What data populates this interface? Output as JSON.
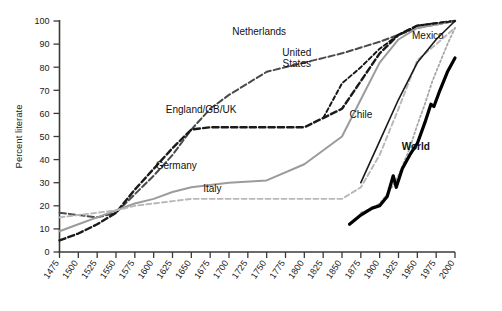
{
  "chart_data": {
    "type": "line",
    "title": "",
    "subtitle": "",
    "xlabel": "",
    "ylabel": "Percent literate",
    "xlim": [
      1475,
      2000
    ],
    "ylim": [
      0,
      100
    ],
    "grid": false,
    "legend_position": "inline-labels",
    "x_ticks": [
      1475,
      1500,
      1525,
      1550,
      1575,
      1600,
      1625,
      1650,
      1675,
      1700,
      1725,
      1750,
      1775,
      1800,
      1825,
      1850,
      1875,
      1900,
      1925,
      1950,
      1975,
      2000
    ],
    "y_ticks": [
      0,
      10,
      20,
      30,
      40,
      50,
      60,
      70,
      80,
      90,
      100
    ],
    "series": [
      {
        "name": "Netherlands",
        "style": "long-dash",
        "color": "#4a4a4a",
        "width": 2.0,
        "label_x": 1740,
        "label_y": 94,
        "x": [
          1475,
          1500,
          1525,
          1550,
          1575,
          1600,
          1625,
          1650,
          1675,
          1700,
          1750,
          1800,
          1850,
          1900,
          1950,
          2000
        ],
        "y": [
          17,
          16,
          15,
          17,
          25,
          33,
          42,
          53,
          62,
          68,
          78,
          82,
          86,
          91,
          97,
          100
        ]
      },
      {
        "name": "England/GB/UK",
        "style": "dash",
        "color": "#1a1a1a",
        "width": 2.4,
        "label_x": 1663,
        "label_y": 60,
        "x": [
          1475,
          1500,
          1525,
          1550,
          1575,
          1600,
          1625,
          1650,
          1675,
          1700,
          1750,
          1800,
          1850,
          1875,
          1900,
          1925,
          1950,
          2000
        ],
        "y": [
          5,
          8,
          12,
          17,
          27,
          36,
          45,
          53,
          54,
          54,
          54,
          54,
          62,
          74,
          86,
          94,
          98,
          100
        ]
      },
      {
        "name": "Germany",
        "style": "solid",
        "color": "#9b9b9b",
        "width": 2.0,
        "label_x": 1630,
        "label_y": 36,
        "x": [
          1475,
          1500,
          1525,
          1550,
          1575,
          1600,
          1625,
          1650,
          1700,
          1750,
          1800,
          1850,
          1875,
          1900,
          1925,
          1950,
          2000
        ],
        "y": [
          9,
          12,
          15,
          18,
          21,
          23,
          26,
          28,
          30,
          31,
          38,
          50,
          66,
          82,
          92,
          97,
          100
        ]
      },
      {
        "name": "Italy",
        "style": "fine-dash",
        "color": "#b8b8b8",
        "width": 1.9,
        "label_x": 1678,
        "label_y": 26,
        "x": [
          1475,
          1500,
          1525,
          1550,
          1575,
          1600,
          1625,
          1650,
          1700,
          1750,
          1800,
          1850,
          1875,
          1900,
          1925,
          1950,
          2000
        ],
        "y": [
          15,
          16,
          17,
          18,
          20,
          21,
          22,
          23,
          23,
          23,
          23,
          23,
          28,
          42,
          62,
          83,
          97
        ]
      },
      {
        "name": "United States",
        "style": "fine-dash-dark",
        "color": "#151515",
        "width": 1.9,
        "label_x": 1790,
        "label_y": 85,
        "x": [
          1825,
          1850,
          1875,
          1900,
          1925,
          1950,
          2000
        ],
        "y": [
          58,
          73,
          80,
          88,
          94,
          98,
          100
        ]
      },
      {
        "name": "Chile",
        "style": "solid",
        "color": "#1a1a1a",
        "width": 1.6,
        "label_x": 1875,
        "label_y": 58,
        "x": [
          1875,
          1900,
          1925,
          1950,
          1975,
          2000
        ],
        "y": [
          30,
          48,
          66,
          82,
          92,
          100
        ]
      },
      {
        "name": "Mexico",
        "style": "dotted",
        "color": "#a8a8a8",
        "width": 1.8,
        "label_x": 1985,
        "label_y": 92,
        "x": [
          1875,
          1890,
          1900,
          1910,
          1920,
          1925,
          1930,
          1940,
          1950,
          1960,
          1970,
          1980,
          1990,
          2000
        ],
        "y": [
          17,
          19,
          21,
          25,
          30,
          33,
          37,
          45,
          55,
          64,
          74,
          82,
          90,
          97
        ]
      },
      {
        "name": "World",
        "style": "solid",
        "color": "#000000",
        "width": 3.2,
        "label_x": 1948,
        "label_y": 44,
        "x": [
          1860,
          1875,
          1890,
          1900,
          1910,
          1918,
          1922,
          1930,
          1940,
          1950,
          1960,
          1968,
          1972,
          1980,
          1990,
          2000
        ],
        "y": [
          12,
          16,
          19,
          20,
          24,
          33,
          28,
          36,
          42,
          47,
          56,
          64,
          63,
          70,
          78,
          84
        ]
      }
    ]
  },
  "axis": {
    "y_title": "Percent literate"
  }
}
